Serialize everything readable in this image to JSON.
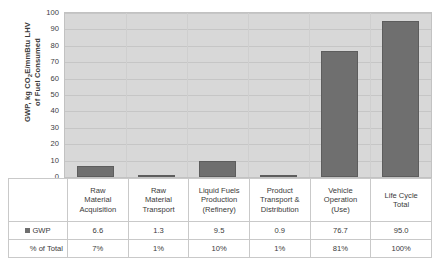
{
  "chart_data": {
    "type": "bar",
    "title": "",
    "xlabel": "",
    "ylabel": "GWP, kg CO2E/mmBtu LHV of Fuel Consumed",
    "ylim": [
      0,
      100
    ],
    "ytick_labels": [
      "100",
      "90",
      "80",
      "70",
      "60",
      "50",
      "40",
      "30",
      "20",
      "10",
      "0"
    ],
    "ytick_values": [
      100,
      90,
      80,
      70,
      60,
      50,
      40,
      30,
      20,
      10,
      0
    ],
    "grid": true,
    "legend_position": "table-row-label",
    "categories": [
      "Raw Material Acquisition",
      "Raw Material Transport",
      "Liquid Fuels Production (Refinery)",
      "Product Transport & Distribution",
      "Vehicle Operation (Use)",
      "Life Cycle Total"
    ],
    "series": [
      {
        "name": "GWP",
        "values": [
          6.6,
          1.3,
          9.5,
          0.9,
          76.7,
          95.0
        ],
        "color": "#6f6f6f"
      }
    ],
    "percent_of_total": [
      "7%",
      "1%",
      "10%",
      "1%",
      "81%",
      "100%"
    ]
  },
  "axis": {
    "y_title_prefix": "GWP, kg CO",
    "y_title_sub": "2",
    "y_title_suffix": "E/mmBtu LHV",
    "y_title_line2": "of Fuel Consumed"
  },
  "table": {
    "headers": [
      {
        "line1": "Raw",
        "line2": "Material",
        "line3": "Acquisition"
      },
      {
        "line1": "Raw",
        "line2": "Material",
        "line3": "Transport"
      },
      {
        "line1": "Liquid Fuels",
        "line2": "Production",
        "line3": "(Refinery)"
      },
      {
        "line1": "Product",
        "line2": "Transport &",
        "line3": "Distribution"
      },
      {
        "line1": "Vehicle",
        "line2": "Operation",
        "line3": "(Use)"
      },
      {
        "line1": "Life Cycle",
        "line2": "Total",
        "line3": ""
      }
    ],
    "rows": [
      {
        "label": "GWP",
        "has_legend_swatch": true,
        "values": [
          "6.6",
          "1.3",
          "9.5",
          "0.9",
          "76.7",
          "95.0"
        ]
      },
      {
        "label": "% of Total",
        "has_legend_swatch": false,
        "values": [
          "7%",
          "1%",
          "10%",
          "1%",
          "81%",
          "100%"
        ]
      }
    ]
  },
  "colors": {
    "bar": "#6f6f6f",
    "bar_border": "#5d5d5d",
    "plot_background": "#d8d8d8",
    "gridline": "#c6c6c6",
    "table_border": "#c9c9c9",
    "text": "#3a3a3a"
  }
}
